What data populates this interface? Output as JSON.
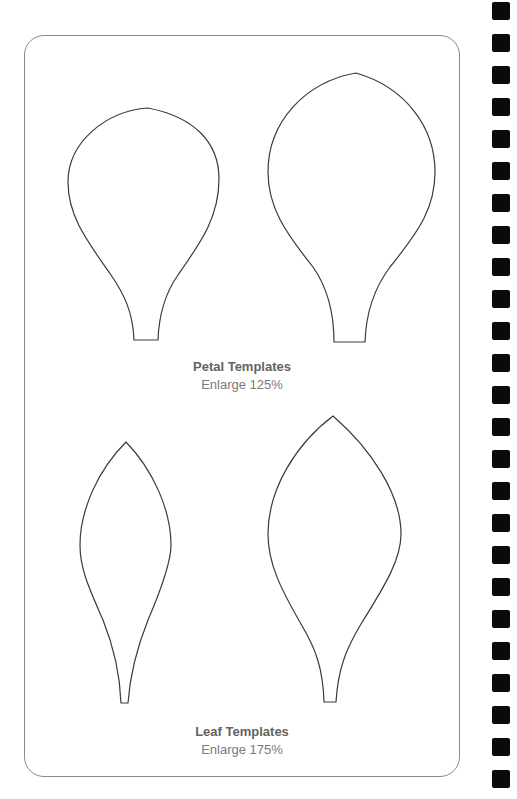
{
  "sections": [
    {
      "title": "Petal Templates",
      "subtitle": "Enlarge 125%",
      "templates": [
        "small-petal",
        "large-petal"
      ]
    },
    {
      "title": "Leaf Templates",
      "subtitle": "Enlarge 175%",
      "templates": [
        "small-leaf",
        "large-leaf"
      ]
    }
  ],
  "binding": {
    "hole_count": 25,
    "color": "#0a0a0a"
  },
  "colors": {
    "outline": "#3a3a3a",
    "frame": "#8a8a8a",
    "caption": "#6d6d6d"
  }
}
